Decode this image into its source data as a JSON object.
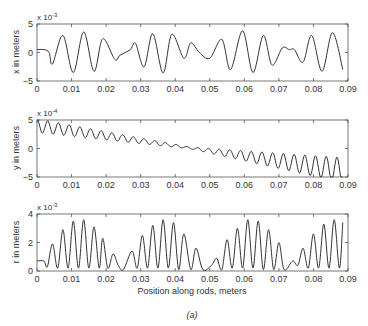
{
  "figure": {
    "caption": "(a)",
    "xlabel": "Position along rods, meters"
  },
  "chart_data": [
    {
      "type": "line",
      "title": "",
      "xlabel": "",
      "ylabel": "x in meters",
      "multiplier": "x 10^-3",
      "multiplier_base": "x 10",
      "multiplier_exp": "-3",
      "xlim": [
        0,
        0.09
      ],
      "ylim": [
        -5,
        5
      ],
      "xticks": [
        "0",
        "0.01",
        "0.02",
        "0.03",
        "0.04",
        "0.05",
        "0.06",
        "0.07",
        "0.08",
        "0.09"
      ],
      "yticks": [
        "5",
        "0",
        "-5"
      ],
      "grid": false,
      "x": [
        0,
        0.002,
        0.0035,
        0.0045,
        0.0075,
        0.0105,
        0.0135,
        0.0165,
        0.019,
        0.0225,
        0.024,
        0.027,
        0.0285,
        0.031,
        0.0335,
        0.0365,
        0.039,
        0.0425,
        0.0445,
        0.047,
        0.05,
        0.0535,
        0.056,
        0.0595,
        0.0625,
        0.0655,
        0.068,
        0.071,
        0.073,
        0.0745,
        0.077,
        0.0795,
        0.0825,
        0.0855,
        0.0885
      ],
      "values": [
        0.5,
        0.5,
        0.0,
        -2.0,
        3.0,
        -3.5,
        3.6,
        -3.3,
        2.4,
        -1.2,
        -0.5,
        0.5,
        1.6,
        -2.5,
        3.3,
        -3.6,
        3.2,
        -1.0,
        1.7,
        0.0,
        -1.0,
        2.3,
        -3.0,
        3.8,
        -3.5,
        3.0,
        -2.2,
        0.8,
        0.5,
        0.5,
        -1.7,
        3.0,
        -3.3,
        3.5,
        -3.0
      ]
    },
    {
      "type": "line",
      "title": "",
      "xlabel": "",
      "ylabel": "y in meters",
      "multiplier": "x 10^-4",
      "multiplier_base": "x 10",
      "multiplier_exp": "-4",
      "xlim": [
        0,
        0.09
      ],
      "ylim": [
        -5,
        5
      ],
      "xticks": [
        "0",
        "0.01",
        "0.02",
        "0.03",
        "0.04",
        "0.05",
        "0.06",
        "0.07",
        "0.08",
        "0.09"
      ],
      "yticks": [
        "5",
        "0",
        "-5"
      ],
      "grid": false,
      "trend": {
        "start": 4.0,
        "end": -3.8,
        "osc_amp_start": 1.2,
        "osc_amp_mid": 0.15,
        "osc_amp_end": 2.2,
        "period": 0.0031
      },
      "x": [
        0,
        0.01,
        0.02,
        0.03,
        0.04,
        0.05,
        0.06,
        0.07,
        0.08,
        0.088
      ],
      "values": [
        4.0,
        3.5,
        2.6,
        1.4,
        0.2,
        -0.6,
        -1.6,
        -2.6,
        -3.2,
        -3.6
      ]
    },
    {
      "type": "line",
      "title": "",
      "xlabel": "Position along rods, meters",
      "ylabel": "r in meters",
      "multiplier": "x 10^-3",
      "multiplier_base": "x 10",
      "multiplier_exp": "-3",
      "xlim": [
        0,
        0.09
      ],
      "ylim": [
        0,
        4
      ],
      "xticks": [
        "0",
        "0.01",
        "0.02",
        "0.03",
        "0.04",
        "0.05",
        "0.06",
        "0.07",
        "0.08",
        "0.09"
      ],
      "yticks": [
        "4",
        "2",
        "0"
      ],
      "grid": false,
      "x": [
        0,
        0.002,
        0.003,
        0.0045,
        0.006,
        0.0075,
        0.009,
        0.0105,
        0.012,
        0.0135,
        0.015,
        0.0165,
        0.018,
        0.019,
        0.0205,
        0.022,
        0.0235,
        0.025,
        0.0275,
        0.029,
        0.0305,
        0.032,
        0.0335,
        0.035,
        0.0365,
        0.038,
        0.0395,
        0.041,
        0.0425,
        0.0445,
        0.046,
        0.048,
        0.0505,
        0.052,
        0.0535,
        0.055,
        0.0565,
        0.058,
        0.0595,
        0.061,
        0.0625,
        0.064,
        0.0655,
        0.067,
        0.0685,
        0.07,
        0.0715,
        0.074,
        0.0755,
        0.077,
        0.0785,
        0.08,
        0.0815,
        0.083,
        0.0845,
        0.086,
        0.0875,
        0.0885
      ],
      "values": [
        0.7,
        0.7,
        0.3,
        1.9,
        0.2,
        2.9,
        0.2,
        3.5,
        0.2,
        3.6,
        0.2,
        3.1,
        0.2,
        2.3,
        0.2,
        1.2,
        0.4,
        0.1,
        1.4,
        0.2,
        2.5,
        0.2,
        3.2,
        0.2,
        3.6,
        0.2,
        3.4,
        0.1,
        2.6,
        0.1,
        1.6,
        0.1,
        0.4,
        0.9,
        0.1,
        2.2,
        0.2,
        3.0,
        0.2,
        3.6,
        0.2,
        3.5,
        0.1,
        2.9,
        0.1,
        2.0,
        0.1,
        0.7,
        0.4,
        1.6,
        0.2,
        2.6,
        0.2,
        3.3,
        0.2,
        3.6,
        0.2,
        3.4
      ]
    }
  ]
}
